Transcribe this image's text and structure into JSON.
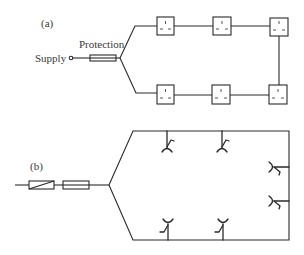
{
  "diagram_a": {
    "label": "(a)",
    "supply_label": "Supply",
    "protection_label": "Protection",
    "description": "Ring circuit: supply through protection fuse, branching into two legs of square socket outlets joined at the far end",
    "socket_outlets": 6
  },
  "diagram_b": {
    "label": "(b)",
    "description": "Ring circuit: switch and fuse feeding a rectangular ring with socket-outlet symbols",
    "socket_outlets": 6
  },
  "colors": {
    "line": "#2a2a2a",
    "text": "#3a3a3a",
    "background": "#ffffff"
  }
}
